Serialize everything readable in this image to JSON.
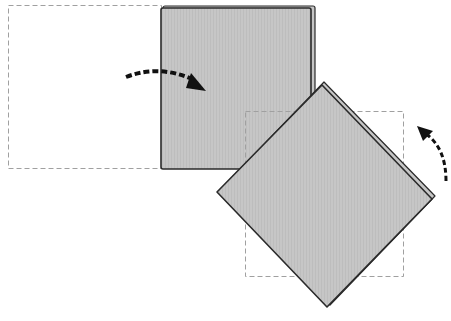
{
  "diagram": {
    "title": "",
    "colors": {
      "background": "#ffffff",
      "paper_fill": "#c4c4c4",
      "paper_edge": "#2a2a2a",
      "paper_edge_highlight": "#f2f2f2",
      "dashed_outline": "#9a9a9a",
      "arrow": "#111111"
    },
    "elements": [
      {
        "id": "ghost-left",
        "type": "dashed-rect",
        "desc": "previous position outline (left)"
      },
      {
        "id": "paper-square",
        "type": "square",
        "desc": "folded paper square, upright"
      },
      {
        "id": "ghost-right",
        "type": "dashed-rect",
        "desc": "previous position outline (lower right)"
      },
      {
        "id": "paper-diamond",
        "type": "square-rotated-45",
        "desc": "paper square rotated into diamond orientation"
      },
      {
        "id": "arrow-right",
        "type": "dashed-curved-arrow",
        "desc": "move/flip to the right"
      },
      {
        "id": "arrow-rotate",
        "type": "dashed-curved-arrow",
        "desc": "rotate counter-clockwise"
      }
    ]
  }
}
